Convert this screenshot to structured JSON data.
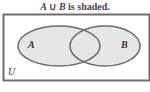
{
  "title": {
    "set_a": "A",
    "operator": "∪",
    "set_b": "B",
    "suffix": "is shaded."
  },
  "diagram": {
    "universe_label": "U",
    "set_a_label": "A",
    "set_b_label": "B",
    "shaded_region": "A ∪ B",
    "colors": {
      "border": "#6e6e6e",
      "shade": "#e6e6e6",
      "background": "#ffffff",
      "text": "#333333"
    }
  }
}
